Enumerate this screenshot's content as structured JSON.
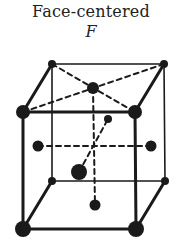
{
  "diagram": {
    "title": "Face-centered",
    "symbol": "F",
    "type": "face-centered cubic unit cell",
    "line_color": "#1a1a1a",
    "lattice_points": {
      "corners": 8,
      "face_centers": 6
    }
  }
}
